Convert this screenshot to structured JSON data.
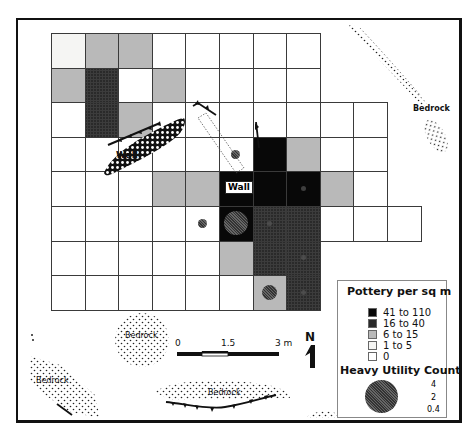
{
  "map": {
    "grid": {
      "origin_x": 51,
      "origin_y": 33,
      "cell_w": 33.6,
      "cell_h": 34.6,
      "rows": [
        [
          1,
          2,
          2,
          0,
          0,
          0,
          0,
          0
        ],
        [
          2,
          3,
          0,
          2,
          0,
          0,
          0,
          0
        ],
        [
          0,
          3,
          2,
          0,
          0,
          0,
          0,
          0,
          0,
          0
        ],
        [
          0,
          0,
          0,
          0,
          0,
          0,
          4,
          2,
          0,
          0
        ],
        [
          0,
          0,
          0,
          2,
          2,
          4,
          4,
          4,
          2,
          0
        ],
        [
          0,
          0,
          0,
          0,
          0,
          4,
          3,
          3,
          0,
          0,
          0
        ],
        [
          0,
          0,
          0,
          0,
          0,
          2,
          3,
          3
        ],
        [
          0,
          0,
          0,
          0,
          0,
          0,
          2,
          3
        ]
      ]
    },
    "labels": {
      "wall_1": "Wall",
      "wall_2": "Wall",
      "bedrock_top_right": "Bedrock",
      "bedrock_bottom_center": "Bedrock",
      "bedrock_bottom_left": "Bedrock",
      "bedrock_bottom": "Bedrock"
    },
    "utility_dots": [
      {
        "row": 3,
        "col": 5,
        "size": "small"
      },
      {
        "row": 4,
        "col": 7,
        "size": "tiny"
      },
      {
        "row": 5,
        "col": 4,
        "size": "small"
      },
      {
        "row": 5,
        "col": 5,
        "size": "large"
      },
      {
        "row": 5,
        "col": 6,
        "size": "tiny"
      },
      {
        "row": 6,
        "col": 7,
        "size": "tiny"
      },
      {
        "row": 7,
        "col": 6,
        "size": "medium"
      },
      {
        "row": 7,
        "col": 7,
        "size": "tiny"
      }
    ],
    "scale_bar": {
      "labels": [
        "0",
        "1.5",
        "3 m"
      ]
    },
    "north_arrow": {
      "label": "N"
    }
  },
  "legend": {
    "pottery_title": "Pottery per sq m",
    "pottery_classes": [
      {
        "range_lo": "41",
        "sep": "to",
        "range_hi": "110",
        "color": "#080808"
      },
      {
        "range_lo": "16",
        "sep": "to",
        "range_hi": "40",
        "color": "#2a2a2a"
      },
      {
        "range_lo": "6",
        "sep": "to",
        "range_hi": "15",
        "color": "#b9b9b9"
      },
      {
        "range_lo": "1",
        "sep": "to",
        "range_hi": "5",
        "color": "#f5f5f3"
      },
      {
        "range_lo": "0",
        "sep": "",
        "range_hi": "",
        "color": "#ffffff"
      }
    ],
    "utility_title": "Heavy Utility Count",
    "utility_values": [
      "4",
      "2",
      "0.4"
    ]
  }
}
